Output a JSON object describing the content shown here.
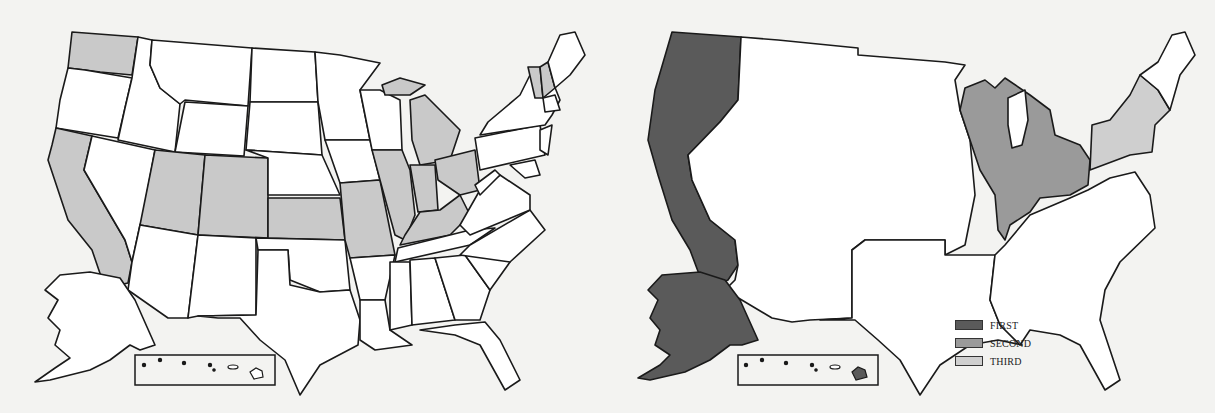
{
  "colors": {
    "background": "#f3f3f1",
    "stroke": "#1a1a1a",
    "unshaded": "#ffffff",
    "left_shaded": "#c9c9c9",
    "first": "#5a5a5a",
    "second": "#9a9a9a",
    "third": "#cfcfcf"
  },
  "left_map": {
    "shaded_states": [
      "Washington",
      "California",
      "Utah",
      "Colorado",
      "Kansas",
      "Missouri",
      "Illinois",
      "Indiana",
      "Ohio",
      "Kentucky",
      "Michigan",
      "Vermont",
      "New Hampshire"
    ]
  },
  "right_map": {
    "regions": [
      {
        "name": "Pacific (WA, OR, CA, AK, HI)",
        "rank": "FIRST"
      },
      {
        "name": "Great Lakes (WI, MI, IL, IN, OH)",
        "rank": "SECOND"
      },
      {
        "name": "Mid-Atlantic (NY, PA, NJ)",
        "rank": "THIRD"
      }
    ],
    "legend": [
      {
        "label": "FIRST",
        "color": "#5a5a5a"
      },
      {
        "label": "SECOND",
        "color": "#9a9a9a"
      },
      {
        "label": "THIRD",
        "color": "#cfcfcf"
      }
    ]
  }
}
